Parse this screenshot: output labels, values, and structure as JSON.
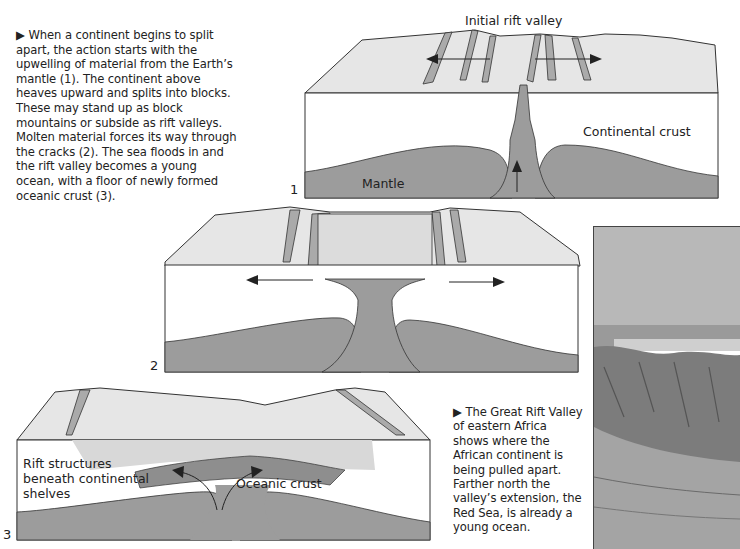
{
  "intro_caption": {
    "marker": "▶",
    "text": "When a continent begins to split apart, the action starts with the upwelling of material from the Earth’s mantle (1). The continent above heaves upward and splits into blocks. These may stand up as block mountains or subside as rift valleys. Molten material forces its way through the cracks (2). The sea floods in and the rift valley becomes a young ocean, with a floor of newly formed oceanic crust (3)."
  },
  "diagrams": [
    {
      "number": "1",
      "labels": {
        "top": "Initial rift valley",
        "crust": "Continental crust",
        "mantle": "Mantle"
      }
    },
    {
      "number": "2",
      "labels": {}
    },
    {
      "number": "3",
      "labels": {
        "rift": "Rift structures beneath continental shelves",
        "rift_lines": [
          "Rift structures",
          "beneath continental",
          "shelves"
        ],
        "ocean": "Oceanic crust"
      }
    }
  ],
  "photo_caption": {
    "marker": "▶",
    "text": "The Great Rift Valley of eastern Africa shows where the African continent is being pulled apart. Farther north the valley’s extension, the Red Sea, is already a young ocean."
  },
  "colors": {
    "surface": "#e4e4e4",
    "crust": "#ffffff",
    "mantle": "#9a9a9a",
    "water": "#d6d6d6",
    "line": "#333333"
  }
}
